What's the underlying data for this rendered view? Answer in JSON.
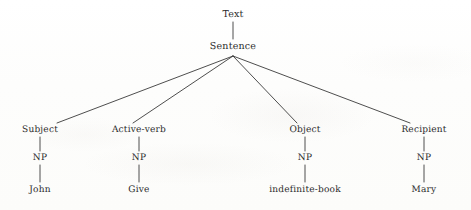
{
  "diagram": {
    "type": "parse-tree",
    "title": "Text",
    "background_color": "#fefefe",
    "ink_color": "#2b2b2b",
    "line_color": "#3a3a3a",
    "root": {
      "label": "Text",
      "x": 233,
      "y": 14
    },
    "sentence": {
      "label": "Sentence",
      "x": 233,
      "y": 46
    },
    "fan_origin": {
      "x": 233,
      "y": 56
    },
    "branches": [
      {
        "role_label": "Subject",
        "role_x": 40,
        "role_y": 130,
        "join_x": 57,
        "join_y": 123,
        "np_label": "NP",
        "np_x": 40,
        "np_y": 158,
        "leaf_label": "John",
        "leaf_x": 40,
        "leaf_y": 190
      },
      {
        "role_label": "Active-verb",
        "role_x": 139,
        "role_y": 130,
        "join_x": 133,
        "join_y": 123,
        "np_label": "NP",
        "np_x": 139,
        "np_y": 158,
        "leaf_label": "Give",
        "leaf_x": 139,
        "leaf_y": 190
      },
      {
        "role_label": "Object",
        "role_x": 305,
        "role_y": 130,
        "join_x": 297,
        "join_y": 123,
        "np_label": "NP",
        "np_x": 305,
        "np_y": 158,
        "leaf_label": "indefinite-book",
        "leaf_x": 305,
        "leaf_y": 190
      },
      {
        "role_label": "Recipient",
        "role_x": 424,
        "role_y": 130,
        "join_x": 410,
        "join_y": 123,
        "np_label": "NP",
        "np_x": 424,
        "np_y": 158,
        "leaf_label": "Mary",
        "leaf_x": 424,
        "leaf_y": 190
      }
    ]
  }
}
